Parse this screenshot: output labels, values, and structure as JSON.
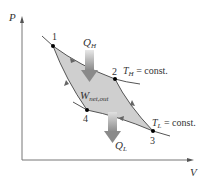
{
  "diagram": {
    "type": "PV-diagram",
    "axes": {
      "y_label": "P",
      "x_label": "V"
    },
    "points": [
      {
        "id": "1",
        "label": "1",
        "x": 53,
        "y": 46
      },
      {
        "id": "2",
        "label": "2",
        "x": 115,
        "y": 79
      },
      {
        "id": "3",
        "label": "3",
        "x": 153,
        "y": 131
      },
      {
        "id": "4",
        "label": "4",
        "x": 87,
        "y": 110
      }
    ],
    "annotations": {
      "q_h": {
        "main": "Q",
        "sub": "H"
      },
      "q_l": {
        "main": "Q",
        "sub": "L"
      },
      "w_net": {
        "main": "W",
        "sub": "net,out"
      },
      "t_h": {
        "main": "T",
        "sub": "H",
        "rest": " = const."
      },
      "t_l": {
        "main": "T",
        "sub": "L",
        "rest": " = const."
      }
    },
    "colors": {
      "fill": "#cfcfcf",
      "curve": "#555555",
      "axis": "#777777",
      "arrow": "#9a9a9a",
      "point": "#000000"
    }
  }
}
